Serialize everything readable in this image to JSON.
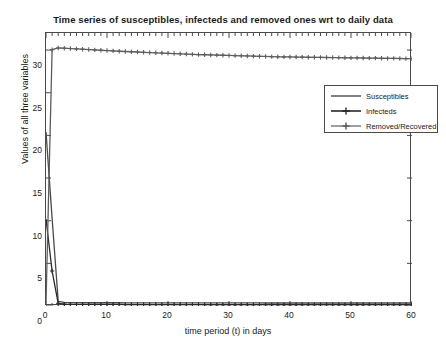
{
  "chart_data": {
    "type": "line",
    "title": "Time series of susceptibles, infecteds and removed ones wrt to daily data",
    "xlabel": "time period (t) in days",
    "ylabel": "Values of all three variables",
    "xlim": [
      0,
      60
    ],
    "ylim": [
      0,
      32
    ],
    "xticks": [
      0,
      10,
      20,
      30,
      40,
      50,
      60
    ],
    "yticks": [
      0,
      5,
      10,
      15,
      20,
      25,
      30
    ],
    "grid": false,
    "legend_position": "upper right",
    "x": [
      0,
      1,
      2,
      3,
      4,
      5,
      6,
      7,
      8,
      9,
      10,
      11,
      12,
      13,
      14,
      15,
      16,
      17,
      18,
      19,
      20,
      21,
      22,
      23,
      24,
      25,
      26,
      27,
      28,
      29,
      30,
      31,
      32,
      33,
      34,
      35,
      36,
      37,
      38,
      39,
      40,
      41,
      42,
      43,
      44,
      45,
      46,
      47,
      48,
      49,
      50,
      51,
      52,
      53,
      54,
      55,
      56,
      57,
      58,
      59,
      60
    ],
    "series": [
      {
        "name": "Susceptibles",
        "color": "#4a4a4a",
        "marker": "none",
        "values": [
          20.4,
          10.3,
          0.55,
          0.42,
          0.4,
          0.39,
          0.39,
          0.38,
          0.38,
          0.38,
          0.38,
          0.38,
          0.38,
          0.37,
          0.37,
          0.37,
          0.37,
          0.37,
          0.37,
          0.37,
          0.37,
          0.37,
          0.36,
          0.36,
          0.36,
          0.36,
          0.36,
          0.36,
          0.36,
          0.36,
          0.36,
          0.36,
          0.36,
          0.36,
          0.36,
          0.36,
          0.35,
          0.35,
          0.35,
          0.35,
          0.35,
          0.35,
          0.35,
          0.35,
          0.35,
          0.35,
          0.35,
          0.35,
          0.35,
          0.35,
          0.35,
          0.35,
          0.35,
          0.35,
          0.35,
          0.35,
          0.35,
          0.35,
          0.35,
          0.35,
          0.35
        ]
      },
      {
        "name": "Infecteds",
        "color": "#2a2a2a",
        "marker": "plus",
        "values": [
          10.2,
          4.1,
          0.32,
          0.22,
          0.2,
          0.19,
          0.19,
          0.18,
          0.18,
          0.18,
          0.18,
          0.18,
          0.18,
          0.17,
          0.17,
          0.17,
          0.17,
          0.17,
          0.17,
          0.17,
          0.17,
          0.17,
          0.17,
          0.17,
          0.17,
          0.17,
          0.16,
          0.16,
          0.16,
          0.16,
          0.16,
          0.16,
          0.16,
          0.16,
          0.16,
          0.16,
          0.16,
          0.16,
          0.16,
          0.16,
          0.16,
          0.16,
          0.16,
          0.16,
          0.16,
          0.16,
          0.16,
          0.16,
          0.16,
          0.16,
          0.16,
          0.16,
          0.16,
          0.16,
          0.16,
          0.16,
          0.16,
          0.16,
          0.16,
          0.16,
          0.16
        ]
      },
      {
        "name": "Removed/Recovered",
        "color": "#5c5c5c",
        "marker": "plus",
        "values": [
          0.3,
          30.05,
          30.25,
          30.22,
          30.18,
          30.14,
          30.1,
          30.06,
          30.02,
          29.98,
          29.94,
          29.9,
          29.86,
          29.83,
          29.8,
          29.77,
          29.74,
          29.71,
          29.68,
          29.65,
          29.62,
          29.59,
          29.56,
          29.53,
          29.5,
          29.47,
          29.45,
          29.43,
          29.41,
          29.39,
          29.37,
          29.35,
          29.33,
          29.31,
          29.29,
          29.27,
          29.25,
          29.23,
          29.21,
          29.2,
          29.19,
          29.18,
          29.17,
          29.16,
          29.15,
          29.14,
          29.13,
          29.12,
          29.11,
          29.1,
          29.09,
          29.08,
          29.07,
          29.06,
          29.05,
          29.04,
          29.03,
          29.02,
          29.01,
          29.0,
          28.99
        ]
      }
    ]
  },
  "axis": {
    "ytick_labels": [
      "30",
      "25",
      "20",
      "15",
      "10",
      "5",
      "0"
    ],
    "xtick_labels": [
      "0",
      "10",
      "20",
      "30",
      "40",
      "50",
      "60"
    ]
  },
  "legend": {
    "entries": [
      {
        "label": "Susceptibles"
      },
      {
        "label": "Infecteds"
      },
      {
        "label": "Removed/Recovered"
      }
    ]
  }
}
